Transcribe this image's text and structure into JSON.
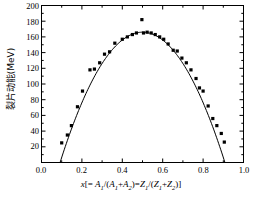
{
  "chart": {
    "ylabel_text": "裂片动能(MeV)",
    "xlabel_parts": {
      "x": "x",
      "open": "[= ",
      "a1": "A",
      "sub1": "1",
      "slash": "/(",
      "a1b": "A",
      "sub1b": "1",
      "plus": "+",
      "a2": "A",
      "sub2": "2",
      "closeparen": ")=",
      "z1": "Z",
      "subz1": "1",
      "slash2": "/(",
      "z1b": "Z",
      "subz1b": "1",
      "plus2": "+",
      "z2": "Z",
      "subz2": "2",
      "close": ")]"
    },
    "ytick_labels": [
      "200",
      "180",
      "160",
      "140",
      "120",
      "100",
      "80",
      "60",
      "40",
      "20"
    ],
    "xtick_labels": [
      "0.0",
      "0.2",
      "0.4",
      "0.6",
      "0.8",
      "1.0"
    ],
    "marker_color": "#000000",
    "line_color": "#000000",
    "axis_color": "#000000"
  },
  "chart_data": {
    "type": "scatter",
    "title": "",
    "xlabel": "x[= A1/(A1+A2)=Z1/(Z1+Z2)]",
    "ylabel": "裂片动能(MeV)",
    "xlim": [
      0.0,
      1.0
    ],
    "ylim": [
      0,
      200
    ],
    "xticks": [
      0.0,
      0.2,
      0.4,
      0.6,
      0.8,
      1.0
    ],
    "yticks": [
      20,
      40,
      60,
      80,
      100,
      120,
      140,
      160,
      180,
      200
    ],
    "grid": false,
    "legend": null,
    "series": [
      {
        "name": "measured fragment kinetic energy",
        "marker": "square",
        "points": [
          [
            0.1,
            25
          ],
          [
            0.128,
            35
          ],
          [
            0.148,
            47
          ],
          [
            0.178,
            71
          ],
          [
            0.203,
            91
          ],
          [
            0.24,
            118
          ],
          [
            0.262,
            119
          ],
          [
            0.288,
            127
          ],
          [
            0.312,
            138
          ],
          [
            0.337,
            141
          ],
          [
            0.363,
            152
          ],
          [
            0.4,
            157
          ],
          [
            0.425,
            160
          ],
          [
            0.45,
            163
          ],
          [
            0.47,
            165
          ],
          [
            0.497,
            182
          ],
          [
            0.505,
            165
          ],
          [
            0.523,
            166
          ],
          [
            0.543,
            165
          ],
          [
            0.563,
            163
          ],
          [
            0.585,
            160
          ],
          [
            0.605,
            157
          ],
          [
            0.627,
            151
          ],
          [
            0.652,
            143
          ],
          [
            0.672,
            142
          ],
          [
            0.695,
            133
          ],
          [
            0.717,
            127
          ],
          [
            0.74,
            118
          ],
          [
            0.765,
            107
          ],
          [
            0.782,
            95
          ],
          [
            0.8,
            91
          ],
          [
            0.825,
            72
          ],
          [
            0.848,
            56
          ],
          [
            0.868,
            47
          ],
          [
            0.89,
            37
          ],
          [
            0.905,
            26
          ]
        ]
      }
    ],
    "fit_curve": {
      "name": "parabolic fit",
      "formula": "y = 166*(1-((x-0.5)/0.41)^2)",
      "x_start": 0.092,
      "x_end": 0.908,
      "peak_x": 0.5,
      "peak_y": 166
    }
  }
}
